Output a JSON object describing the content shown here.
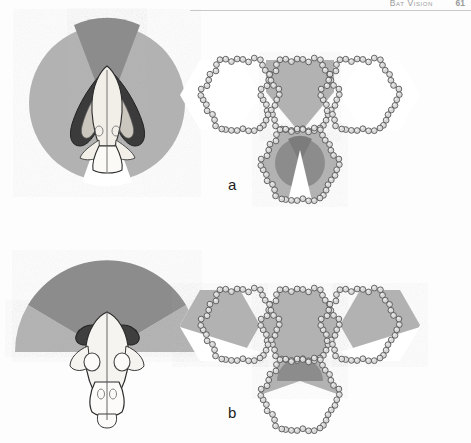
{
  "header": {
    "running_title": "Bat Vision",
    "page_number": "61"
  },
  "figure": {
    "panels": [
      {
        "id": "a",
        "label": "a",
        "left_diagram": {
          "name": "skull-visual-field-top-view-a",
          "description": "Bat skull viewed from above with visual field sectors",
          "field_shape": "circle",
          "sectors": [
            {
              "name": "monocular-field",
              "tone": "light-gray",
              "color": "#b2b2b2",
              "start_deg": -180,
              "end_deg": 0
            },
            {
              "name": "binocular-field",
              "tone": "dark-gray",
              "color": "#8c8c8c",
              "half_angle_deg": 22
            },
            {
              "name": "blind-area",
              "tone": "white",
              "color": "#ffffff",
              "half_angle_deg": 17
            }
          ]
        },
        "right_diagram": {
          "name": "hexagonal-cluster-a",
          "description": "Cluster of four hexagonal cell outlines built from chains of small round cells",
          "hexagons": [
            {
              "name": "hex-top-center",
              "fill": "#b2b2b2",
              "shaded": true
            },
            {
              "name": "hex-left",
              "fill": "#ffffff",
              "shaded": false
            },
            {
              "name": "hex-right",
              "fill": "#ffffff",
              "shaded": false
            },
            {
              "name": "hex-bottom-center",
              "fill": "#b2b2b2",
              "shaded": true,
              "inner_disc": "#8c8c8c",
              "inner_wedge": "#7c7c7c",
              "notch": "#ffffff"
            }
          ]
        }
      },
      {
        "id": "b",
        "label": "b",
        "left_diagram": {
          "name": "skull-visual-field-top-view-b",
          "description": "Bat skull viewed from above with wide dark dome visual field",
          "field_shape": "half-dome",
          "sectors": [
            {
              "name": "wide-field-dome",
              "tone": "dark-gray",
              "color": "#8c8c8c",
              "half_angle_deg": 62
            },
            {
              "name": "lateral-field",
              "tone": "light-gray",
              "color": "#b2b2b2"
            }
          ]
        },
        "right_diagram": {
          "name": "hexagonal-cluster-b",
          "description": "Cluster of four hexagonal cell outlines with broad shading across three cells",
          "hexagons": [
            {
              "name": "hex-top-center",
              "fill": "#b2b2b2",
              "shaded": true
            },
            {
              "name": "hex-left",
              "fill": "#b2b2b2",
              "shaded": true
            },
            {
              "name": "hex-right",
              "fill": "#b2b2b2",
              "shaded": true
            },
            {
              "name": "hex-bottom-center",
              "fill": "#ffffff",
              "shaded": false,
              "inner_dome": "#8c8c8c"
            }
          ]
        }
      }
    ],
    "colors": {
      "light_gray": "#b2b2b2",
      "mid_gray": "#9d9d9d",
      "dark_gray": "#8c8c8c",
      "darker_gray": "#7c7c7c",
      "outline": "#5a5a5a",
      "white": "#ffffff",
      "bone": "#f2efe9",
      "ink": "#1c1c1c"
    }
  }
}
